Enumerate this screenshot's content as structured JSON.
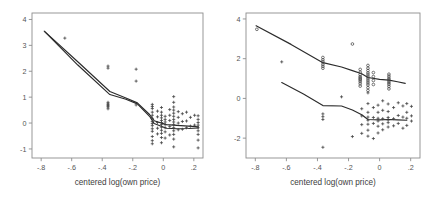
{
  "figure": {
    "background": "#ffffff",
    "marker_color": "#3c3c3c",
    "line_color": "#2b2b2b",
    "axis_color": "#8d8d8d",
    "panel_count": 2
  },
  "chart_data": [
    {
      "type": "scatter",
      "panel": "left",
      "title": "",
      "xlabel": "centered log(own price)",
      "ylabel": "",
      "xlim": [
        -0.86,
        0.26
      ],
      "ylim": [
        -1.35,
        4.25
      ],
      "xticks": [
        -0.8,
        -0.6,
        -0.4,
        -0.2,
        0,
        0.2
      ],
      "xticklabels": [
        "-.8",
        "-.6",
        "-.4",
        "-.2",
        "0",
        ".2"
      ],
      "yticks": [
        -1,
        0,
        1,
        2,
        3,
        4
      ],
      "yticklabels": [
        "-1",
        "0",
        "1",
        "2",
        "3",
        "4"
      ],
      "grid": false,
      "legend": "none",
      "series": [
        {
          "name": "fit-upper",
          "type": "line",
          "marker": "none",
          "x": [
            -0.78,
            -0.555,
            -0.35,
            -0.245,
            -0.17,
            -0.09,
            -0.06,
            0.02,
            0.09,
            0.165,
            0.23
          ],
          "y": [
            3.55,
            2.34,
            1.22,
            0.97,
            0.78,
            0.33,
            0.09,
            -0.06,
            -0.09,
            -0.12,
            -0.15
          ]
        },
        {
          "name": "fit-lower",
          "type": "line",
          "marker": "none",
          "x": [
            -0.775,
            -0.56,
            -0.35,
            -0.245,
            -0.17,
            -0.09,
            -0.06,
            0.02,
            0.09,
            0.165,
            0.23
          ],
          "y": [
            3.52,
            2.24,
            1.1,
            0.92,
            0.74,
            0.26,
            -0.02,
            -0.2,
            -0.22,
            -0.21,
            -0.19
          ]
        },
        {
          "name": "residual-points",
          "type": "scatter",
          "marker": "plus",
          "x": [
            -0.645,
            -0.362,
            -0.362,
            -0.362,
            -0.362,
            -0.362,
            -0.362,
            -0.362,
            -0.362,
            -0.178,
            -0.178,
            -0.178,
            -0.072,
            -0.072,
            -0.072,
            -0.072,
            -0.072,
            -0.072,
            -0.072,
            -0.072,
            -0.072,
            -0.072,
            -0.072,
            -0.072,
            -0.072,
            -0.072,
            -0.038,
            -0.038,
            -0.038,
            -0.038,
            -0.038,
            -0.012,
            -0.012,
            -0.012,
            -0.012,
            -0.012,
            -0.012,
            -0.012,
            -0.012,
            -0.012,
            -0.012,
            -0.012,
            -0.012,
            0.012,
            0.012,
            0.012,
            0.012,
            0.012,
            0.012,
            0.012,
            0.042,
            0.042,
            0.042,
            0.042,
            0.042,
            0.068,
            0.068,
            0.068,
            0.068,
            0.068,
            0.068,
            0.068,
            0.068,
            0.068,
            0.068,
            0.068,
            0.068,
            0.068,
            0.068,
            0.098,
            0.098,
            0.098,
            0.098,
            0.125,
            0.125,
            0.125,
            0.152,
            0.152,
            0.152,
            0.178,
            0.178,
            0.205,
            0.205,
            0.228,
            0.228,
            0.228,
            0.228,
            0.228,
            0.228,
            0.228,
            0.228,
            0.228
          ],
          "y": [
            3.28,
            2.2,
            2.12,
            0.8,
            0.74,
            0.7,
            0.66,
            0.62,
            0.55,
            2.08,
            1.62,
            0.7,
            0.72,
            0.64,
            0.56,
            0.42,
            0.3,
            0.18,
            0.06,
            -0.02,
            -0.1,
            -0.22,
            -0.32,
            -0.52,
            -0.68,
            -0.8,
            0.46,
            0.24,
            0.02,
            -0.2,
            -0.42,
            0.6,
            0.42,
            0.3,
            0.2,
            0.1,
            0.02,
            -0.06,
            -0.16,
            -0.28,
            -0.4,
            -0.56,
            -0.76,
            0.26,
            0.14,
            0.04,
            -0.06,
            -0.18,
            -0.34,
            -0.58,
            0.52,
            0.3,
            0.1,
            -0.14,
            -0.46,
            1.02,
            0.8,
            0.62,
            0.5,
            0.38,
            0.26,
            0.14,
            0.04,
            -0.06,
            -0.18,
            -0.3,
            -0.44,
            -0.62,
            -0.92,
            0.44,
            0.22,
            0.0,
            -0.26,
            0.36,
            0.06,
            -0.24,
            0.42,
            0.08,
            -0.18,
            0.22,
            -0.12,
            0.3,
            -0.08,
            0.28,
            0.14,
            0.02,
            -0.08,
            -0.18,
            -0.3,
            -0.44,
            -0.66,
            -0.96
          ]
        }
      ]
    },
    {
      "type": "scatter",
      "panel": "right",
      "title": "",
      "xlabel": "centered log(own price)",
      "ylabel": "",
      "xlim": [
        -0.86,
        0.26
      ],
      "ylim": [
        -3.0,
        4.3
      ],
      "xticks": [
        -0.8,
        -0.6,
        -0.4,
        -0.2,
        0,
        0.2
      ],
      "xticklabels": [
        "-.8",
        "-.6",
        "-.4",
        "-.2",
        "0",
        ".2"
      ],
      "yticks": [
        -2,
        0,
        2,
        4
      ],
      "yticklabels": [
        "-2",
        "0",
        "2",
        "4"
      ],
      "grid": false,
      "legend": "none",
      "series": [
        {
          "name": "fit-upper",
          "type": "line",
          "marker": "none",
          "x": [
            -0.795,
            -0.57,
            -0.365,
            -0.245,
            -0.175,
            -0.115,
            -0.075,
            0.0,
            0.06,
            0.115,
            0.165
          ],
          "y": [
            3.66,
            2.72,
            1.8,
            1.58,
            1.4,
            1.24,
            1.05,
            0.96,
            0.92,
            0.84,
            0.76
          ]
        },
        {
          "name": "fit-lower",
          "type": "line",
          "marker": "none",
          "x": [
            -0.63,
            -0.49,
            -0.365,
            -0.245,
            -0.175,
            -0.115,
            -0.075,
            0.0,
            0.06,
            0.115,
            0.175
          ],
          "y": [
            0.8,
            0.22,
            -0.36,
            -0.38,
            -0.58,
            -0.82,
            -1.06,
            -1.08,
            -1.06,
            -1.08,
            -1.1
          ]
        },
        {
          "name": "upper-cloud",
          "type": "scatter",
          "marker": "circle",
          "x": [
            -0.79,
            -0.365,
            -0.365,
            -0.365,
            -0.365,
            -0.365,
            -0.365,
            -0.175,
            -0.125,
            -0.125,
            -0.125,
            -0.125,
            -0.125,
            -0.125,
            -0.125,
            -0.125,
            -0.125,
            -0.125,
            -0.075,
            -0.075,
            -0.075,
            -0.075,
            -0.075,
            -0.075,
            -0.075,
            -0.075,
            -0.075,
            -0.075,
            -0.075,
            -0.075,
            -0.04,
            -0.04,
            -0.04,
            -0.04,
            0.06,
            0.06,
            0.06,
            0.06,
            0.06,
            0.06,
            0.06,
            0.06,
            0.06
          ],
          "y": [
            3.48,
            2.06,
            1.94,
            1.84,
            1.72,
            1.62,
            1.52,
            2.74,
            1.46,
            1.32,
            1.2,
            1.1,
            1.04,
            0.98,
            0.92,
            0.84,
            0.74,
            0.62,
            1.66,
            1.52,
            1.4,
            1.28,
            1.18,
            1.08,
            0.98,
            0.88,
            0.78,
            0.68,
            0.54,
            0.4,
            1.3,
            1.1,
            0.9,
            0.7,
            1.22,
            1.12,
            1.02,
            0.94,
            0.86,
            0.78,
            0.7,
            0.6,
            0.48
          ]
        },
        {
          "name": "lower-cloud",
          "type": "scatter",
          "marker": "plus",
          "x": [
            -0.63,
            -0.365,
            -0.365,
            -0.365,
            -0.365,
            -0.245,
            -0.175,
            -0.115,
            -0.115,
            -0.115,
            -0.115,
            -0.075,
            -0.075,
            -0.075,
            -0.075,
            -0.075,
            -0.075,
            -0.075,
            -0.075,
            -0.04,
            -0.04,
            -0.04,
            -0.04,
            -0.01,
            -0.01,
            -0.01,
            -0.01,
            -0.01,
            -0.01,
            0.02,
            0.02,
            0.02,
            0.02,
            0.02,
            0.055,
            0.055,
            0.055,
            0.055,
            0.055,
            0.055,
            0.09,
            0.09,
            0.09,
            0.12,
            0.12,
            0.12,
            0.15,
            0.15,
            0.15,
            0.175,
            0.175,
            0.175,
            0.175,
            0.205,
            0.205,
            0.205
          ],
          "y": [
            1.84,
            -0.78,
            -0.92,
            -1.06,
            -2.46,
            0.08,
            -1.92,
            -0.52,
            -0.88,
            -1.32,
            -1.76,
            0.28,
            -0.26,
            -0.7,
            -0.94,
            -1.1,
            -1.3,
            -1.6,
            -1.9,
            -0.46,
            -0.96,
            -1.26,
            -2.02,
            -0.34,
            -0.7,
            -1.0,
            -1.14,
            -1.4,
            -1.74,
            -0.12,
            -0.6,
            -1.02,
            -1.28,
            -1.58,
            -0.28,
            -0.66,
            -0.96,
            -1.08,
            -1.22,
            -1.44,
            -0.46,
            -1.02,
            -1.38,
            -0.22,
            -0.86,
            -1.26,
            -0.38,
            -0.94,
            -1.5,
            -0.26,
            -0.7,
            -1.0,
            -1.36,
            -0.4,
            -0.88,
            -1.14
          ]
        }
      ]
    }
  ]
}
